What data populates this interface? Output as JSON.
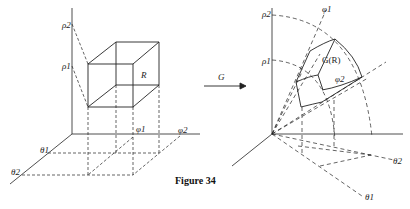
{
  "figure": {
    "caption": "Figure 34",
    "map_label": "G",
    "left_panel": {
      "region_label": "R",
      "axis_labels": {
        "rho1": "ρ1",
        "rho2": "ρ2",
        "phi1": "φ1",
        "phi2": "φ2",
        "theta1": "θ1",
        "theta2": "θ2"
      }
    },
    "right_panel": {
      "region_label": "G(R)",
      "axis_labels": {
        "rho1": "ρ1",
        "rho2": "ρ2",
        "phi1": "φ1",
        "phi2": "φ2",
        "theta1": "θ1",
        "theta2": "θ2"
      }
    }
  }
}
